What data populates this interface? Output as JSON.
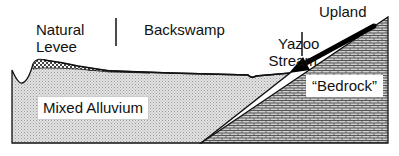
{
  "diagram": {
    "title": "",
    "labels": {
      "natural_levee_line1": "Natural",
      "natural_levee_line2": "Levee",
      "backswamp": "Backswamp",
      "yazoo_line1": "Yazoo",
      "yazoo_line2": "Stream",
      "upland": "Upland",
      "bedrock": "“Bedrock”",
      "mixed_alluvium": "Mixed Alluvium"
    },
    "regions": [
      {
        "name": "levee-deposit",
        "pattern": "checkered"
      },
      {
        "name": "mixed-alluvium",
        "pattern": "fine-stipple"
      },
      {
        "name": "bedrock-upland",
        "pattern": "brick"
      }
    ],
    "colors": {
      "outline": "#111111",
      "alluvium_fill": "#d6d6d6",
      "bedrock_fill": "#c4c4c4",
      "levee_fill": "#bdbdbd",
      "background": "#ffffff"
    },
    "arrow": {
      "from": "Bedrock label",
      "to": "Yazoo Stream / bedrock contact"
    }
  }
}
